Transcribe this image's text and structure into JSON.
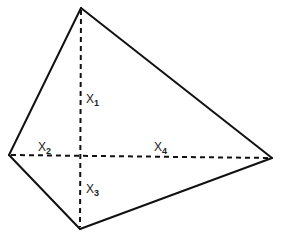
{
  "diagram": {
    "shape": "quadrilateral",
    "vertices": [
      "top",
      "right",
      "bottom",
      "left"
    ],
    "edges": [
      {
        "from": "top",
        "to": "right",
        "style": "solid"
      },
      {
        "from": "right",
        "to": "bottom",
        "style": "solid"
      },
      {
        "from": "bottom",
        "to": "left",
        "style": "solid"
      },
      {
        "from": "left",
        "to": "top",
        "style": "solid"
      }
    ],
    "diagonals": [
      {
        "from": "top",
        "to": "bottom",
        "style": "dashed"
      },
      {
        "from": "left",
        "to": "right",
        "style": "dashed"
      }
    ],
    "segments": [
      {
        "id": "x1",
        "base": "X",
        "subscript": "1",
        "description": "upper part of vertical diagonal"
      },
      {
        "id": "x2",
        "base": "X",
        "subscript": "2",
        "description": "left part of horizontal diagonal"
      },
      {
        "id": "x3",
        "base": "X",
        "subscript": "3",
        "description": "lower part of vertical diagonal"
      },
      {
        "id": "x4",
        "base": "X",
        "subscript": "4",
        "description": "right part of horizontal diagonal"
      }
    ],
    "colors": {
      "line": "#111111",
      "text": "#222222",
      "background": "#ffffff"
    }
  }
}
